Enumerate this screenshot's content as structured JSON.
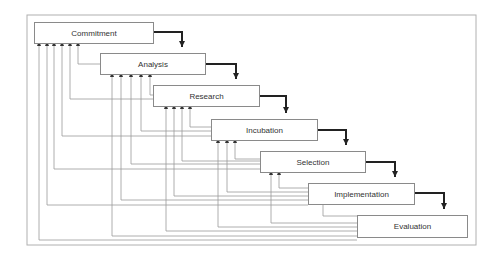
{
  "diagram": {
    "type": "waterfall-process-with-feedback",
    "stages": [
      {
        "id": "commitment",
        "label": "Commitment",
        "x": 34,
        "y": 22,
        "w": 120,
        "h": 22
      },
      {
        "id": "analysis",
        "label": "Analysis",
        "x": 100,
        "y": 53,
        "w": 106,
        "h": 22
      },
      {
        "id": "research",
        "label": "Research",
        "x": 153,
        "y": 85,
        "w": 107,
        "h": 22
      },
      {
        "id": "incubation",
        "label": "Incubation",
        "x": 211,
        "y": 119,
        "w": 107,
        "h": 22
      },
      {
        "id": "selection",
        "label": "Selection",
        "x": 260,
        "y": 151,
        "w": 106,
        "h": 22
      },
      {
        "id": "implementation",
        "label": "Implementation",
        "x": 308,
        "y": 183,
        "w": 107,
        "h": 22
      },
      {
        "id": "evaluation",
        "label": "Evaluation",
        "x": 357,
        "y": 215,
        "w": 111,
        "h": 23
      }
    ],
    "forward_flow": [
      "Commitment",
      "Analysis",
      "Research",
      "Incubation",
      "Selection",
      "Implementation",
      "Evaluation"
    ],
    "feedback_note": "Every later stage has a feedback line returning to each earlier stage",
    "colors": {
      "box_border": "#8a8a8a",
      "forward_arrow": "#222222",
      "feedback_line": "#9a9a9a",
      "frame": "#b0b0b0",
      "text": "#333333"
    }
  }
}
